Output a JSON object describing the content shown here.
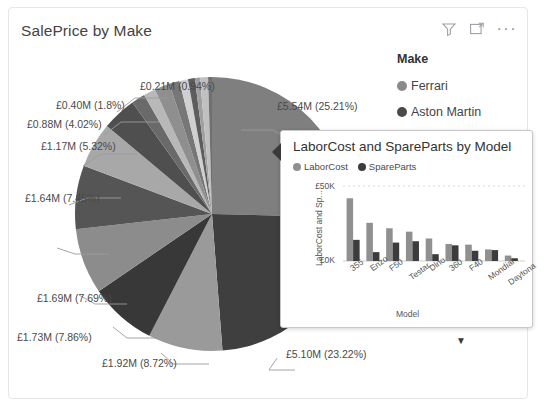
{
  "visual": {
    "title": "SalePrice by Make",
    "header_icons": [
      {
        "name": "filter-icon",
        "label": "Filters"
      },
      {
        "name": "focus-mode-icon",
        "label": "Focus mode"
      },
      {
        "name": "more-options-icon",
        "label": "More options"
      }
    ],
    "more_options_glyph": "···"
  },
  "legend": {
    "title": "Make",
    "items": [
      {
        "label": "Ferrari",
        "color": "#8a8a8a"
      },
      {
        "label": "Aston Martin",
        "color": "#4a4a4a"
      },
      {
        "label": "Bugatti",
        "color": "#9e9e9e"
      },
      {
        "label": "Alfa Romeo",
        "color": "#8f8f8f"
      },
      {
        "label": "Lagonda",
        "color": "#b5b5b5"
      },
      {
        "label": "Noble",
        "color": "#6f6f6f"
      }
    ],
    "expand_glyph": "▼"
  },
  "chart_data": {
    "type": "pie",
    "title": "SalePrice by Make",
    "legend_title": "Make",
    "legend_position": "right",
    "value_format": "£#.##M (#.##%)",
    "slices": [
      {
        "label": "£5.54M (25.21%)",
        "value": 5.54,
        "percent": 25.21,
        "color": "#7f7f7f"
      },
      {
        "label": "£5.10M (23.22%)",
        "value": 5.1,
        "percent": 23.22,
        "color": "#3f3f3f"
      },
      {
        "label": "£1.92M (8.72%)",
        "value": 1.92,
        "percent": 8.72,
        "color": "#9a9a9a"
      },
      {
        "label": "£1.73M (7.86%)",
        "value": 1.73,
        "percent": 7.86,
        "color": "#383838"
      },
      {
        "label": "£1.69M (7.69%)",
        "value": 1.69,
        "percent": 7.69,
        "color": "#8c8c8c"
      },
      {
        "label": "£1.64M (7.45%)",
        "value": 1.64,
        "percent": 7.45,
        "color": "#555555"
      },
      {
        "label": "£1.17M (5.32%)",
        "value": 1.17,
        "percent": 5.32,
        "color": "#a8a8a8"
      },
      {
        "label": "£0.88M (4.02%)",
        "value": 0.88,
        "percent": 4.02,
        "color": "#4f4f4f"
      },
      {
        "label": "£0.40M (1.8%)",
        "value": 0.4,
        "percent": 1.8,
        "color": "#8f8f8f"
      },
      {
        "label": "£0.21M (0.94%)",
        "value": 0.21,
        "percent": 0.94,
        "color": "#c0c0c0"
      }
    ],
    "unlabeled_slices": [
      {
        "percent": 1.6,
        "color": "#6a6a6a"
      },
      {
        "percent": 1.4,
        "color": "#b8b8b8"
      },
      {
        "percent": 1.2,
        "color": "#777777"
      },
      {
        "percent": 1.0,
        "color": "#d0d0d0"
      },
      {
        "percent": 0.8,
        "color": "#5d5d5d"
      },
      {
        "percent": 0.6,
        "color": "#a0a0a0"
      },
      {
        "percent": 0.45,
        "color": "#707070"
      }
    ]
  },
  "tooltip": {
    "title": "LaborCost and SpareParts by Model",
    "legend": [
      {
        "label": "LaborCost",
        "color": "#909090"
      },
      {
        "label": "SpareParts",
        "color": "#3c3c3c"
      }
    ],
    "chart_data": {
      "type": "bar",
      "title": "LaborCost and SpareParts by Model",
      "xlabel": "Model",
      "ylabel": "LaborCost and Sp...",
      "ylim": [
        0,
        55000
      ],
      "yticks": [
        "£0K",
        "£50K"
      ],
      "ytick_values": [
        0,
        50000
      ],
      "grid": true,
      "categories": [
        "355",
        "Enzo",
        "F50",
        "Testar...",
        "Dino",
        "360",
        "F40",
        "Mondial",
        "Daytona"
      ],
      "series": [
        {
          "name": "LaborCost",
          "color": "#909090",
          "values": [
            46000,
            28000,
            24000,
            21500,
            16500,
            12500,
            12000,
            8500,
            4000
          ]
        },
        {
          "name": "SpareParts",
          "color": "#3c3c3c",
          "values": [
            15500,
            6500,
            13500,
            14500,
            5000,
            11500,
            7500,
            8000,
            2000
          ]
        }
      ]
    }
  }
}
